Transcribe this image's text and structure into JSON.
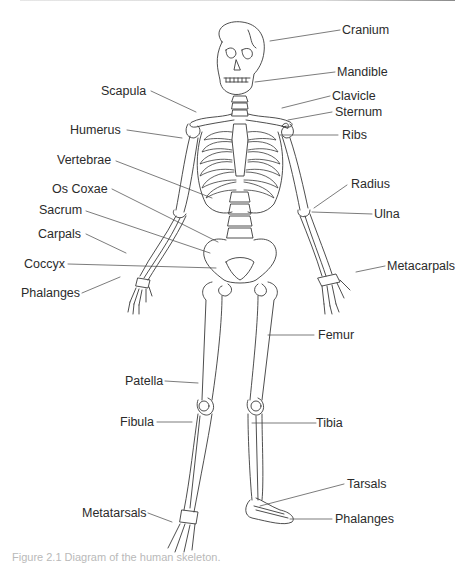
{
  "figure": {
    "caption": "Figure 2.1 Diagram of the human skeleton.",
    "line_color": "#3a3a3a",
    "text_color": "#2b2b2b"
  },
  "labels": {
    "cranium": "Cranium",
    "mandible": "Mandible",
    "clavicle": "Clavicle",
    "sternum": "Sternum",
    "ribs": "Ribs",
    "scapula": "Scapula",
    "humerus": "Humerus",
    "vertebrae": "Vertebrae",
    "os_coxae": "Os Coxae",
    "sacrum": "Sacrum",
    "carpals": "Carpals",
    "coccyx": "Coccyx",
    "phalanges_hand": "Phalanges",
    "radius": "Radius",
    "ulna": "Ulna",
    "metacarpals": "Metacarpals",
    "femur": "Femur",
    "patella": "Patella",
    "fibula": "Fibula",
    "tibia": "Tibia",
    "tarsals": "Tarsals",
    "metatarsals": "Metatarsals",
    "phalanges_foot": "Phalanges"
  }
}
